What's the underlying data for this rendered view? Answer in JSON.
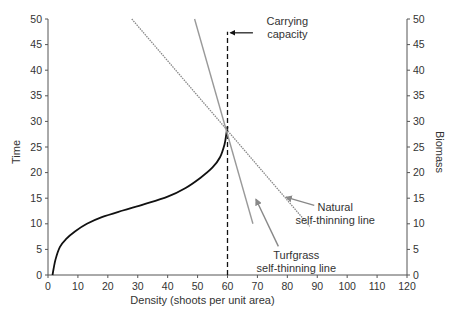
{
  "chart_data": {
    "type": "line",
    "title": "",
    "xlabel": "Density (shoots per unit area)",
    "ylabel": "Time",
    "y2label": "Biomass",
    "xlim": [
      0,
      120
    ],
    "ylim": [
      0,
      50
    ],
    "y2lim": [
      0,
      50
    ],
    "x_ticks": [
      0,
      10,
      20,
      30,
      40,
      50,
      60,
      70,
      80,
      90,
      100,
      110,
      120
    ],
    "y_ticks": [
      0,
      5,
      10,
      15,
      20,
      25,
      30,
      35,
      40,
      45,
      50
    ],
    "y2_ticks": [
      0,
      5,
      10,
      15,
      20,
      25,
      30,
      35,
      40,
      45,
      50
    ],
    "grid": false,
    "legend": null,
    "series": [
      {
        "name": "Population growth curve",
        "axis": "left",
        "style": "solid",
        "color": "#111111",
        "points": [
          [
            1.5,
            0
          ],
          [
            2.5,
            3
          ],
          [
            4,
            5.5
          ],
          [
            6,
            7
          ],
          [
            9,
            8.5
          ],
          [
            13,
            10
          ],
          [
            18,
            11.3
          ],
          [
            25,
            12.6
          ],
          [
            32,
            13.8
          ],
          [
            40,
            15.3
          ],
          [
            46,
            17
          ],
          [
            51,
            19
          ],
          [
            55,
            21
          ],
          [
            57.5,
            23
          ],
          [
            59,
            25.5
          ],
          [
            59.6,
            27.5
          ],
          [
            60,
            29
          ]
        ]
      },
      {
        "name": "Carrying capacity",
        "axis": "left",
        "style": "dashed",
        "color": "#111111",
        "points": [
          [
            60,
            0
          ],
          [
            60,
            47.5
          ]
        ]
      },
      {
        "name": "Natural self-thinning line",
        "axis": "right",
        "style": "dotted",
        "color": "#888888",
        "points": [
          [
            28,
            50
          ],
          [
            87.5,
            9.5
          ]
        ]
      },
      {
        "name": "Turfgrass self-thinning line",
        "axis": "right",
        "style": "solid",
        "color": "#999999",
        "points": [
          [
            49,
            50
          ],
          [
            68.5,
            10
          ]
        ]
      }
    ],
    "annotations": [
      {
        "text_lines": [
          "Carrying",
          "capacity"
        ],
        "label_at": [
          80,
          48.8
        ],
        "arrow_from": [
          68.5,
          47.3
        ],
        "arrow_to": [
          61,
          47.3
        ]
      },
      {
        "text_lines": [
          "Natural",
          "self-thinning line"
        ],
        "label_at": [
          96,
          12.5
        ],
        "arrow_from": [
          89,
          13.6
        ],
        "arrow_to": [
          79.5,
          15.2
        ]
      },
      {
        "text_lines": [
          "Turfgrass",
          "self-thinning line"
        ],
        "label_at": [
          83,
          3.2
        ],
        "arrow_from": [
          77,
          5.6
        ],
        "arrow_to": [
          69.5,
          14.8
        ]
      }
    ]
  },
  "layout": {
    "width": 452,
    "height": 322,
    "plot_left": 48,
    "plot_right": 407,
    "plot_top": 19,
    "plot_bottom": 275
  }
}
